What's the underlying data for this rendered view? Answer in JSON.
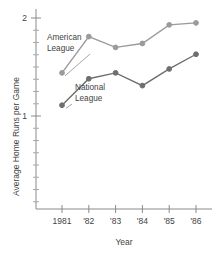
{
  "chart_data": {
    "type": "line",
    "title": "",
    "subtitle": "",
    "xlabel": "Year",
    "ylabel": "Average Home Runs per Game",
    "x": [
      1981,
      1982,
      1983,
      1984,
      1985,
      1986
    ],
    "categories": [
      "1981",
      "'82",
      "'83",
      "'84",
      "'85",
      "'86"
    ],
    "series": [
      {
        "name": "American League",
        "color": "#9b9b9b",
        "values": [
          1.44,
          1.81,
          1.7,
          1.74,
          1.93,
          1.95
        ]
      },
      {
        "name": "National League",
        "color": "#6e6e6e",
        "values": [
          1.11,
          1.38,
          1.44,
          1.31,
          1.48,
          1.63
        ]
      }
    ],
    "ylim": [
      0.0,
      2.1
    ],
    "xlim": [
      1980.6,
      1986.6
    ],
    "yticks_major": [
      1,
      2
    ],
    "ytick_labels": [
      "1",
      "2"
    ],
    "ytick_minor_step": 0.125,
    "grid": false,
    "legend": "none",
    "annotations": [
      {
        "text_line1": "American",
        "text_line2": "League",
        "target_series": "American League",
        "target_x": 1981
      },
      {
        "text_line1": "National",
        "text_line2": "League",
        "target_series": "National League",
        "target_x": 1981
      }
    ]
  },
  "axes": {
    "y_title": "Average Home Runs per Game",
    "x_title": "Year",
    "y_tick_top": "2",
    "y_tick_bottom": "1",
    "x_tick_labels": [
      "1981",
      "'82",
      "'83",
      "'84",
      "'85",
      "'86"
    ]
  },
  "annotations": {
    "american_line1": "American",
    "american_line2": "League",
    "national_line1": "National",
    "national_line2": "League"
  },
  "colors": {
    "american_league": "#9b9b9b",
    "national_league": "#6e6e6e",
    "axis": "#8a8a8a",
    "text": "#3f3f3f",
    "background": "#ffffff"
  }
}
